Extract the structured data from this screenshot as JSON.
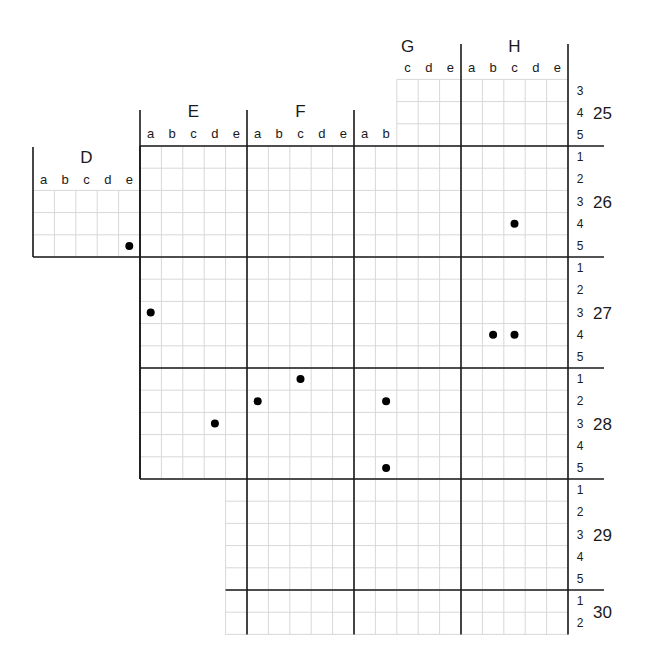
{
  "column_blocks": [
    {
      "label": "D",
      "subcolumns": [
        "a",
        "b",
        "c",
        "d",
        "e"
      ]
    },
    {
      "label": "E",
      "subcolumns": [
        "a",
        "b",
        "c",
        "d",
        "e"
      ]
    },
    {
      "label": "F",
      "subcolumns": [
        "a",
        "b",
        "c",
        "d",
        "e"
      ]
    },
    {
      "label": "G",
      "subcolumns": [
        "a",
        "b",
        "c",
        "d",
        "e"
      ]
    },
    {
      "label": "H",
      "subcolumns": [
        "a",
        "b",
        "c",
        "d",
        "e"
      ]
    }
  ],
  "row_bands": [
    {
      "label": "25",
      "subrows": [
        "3",
        "4",
        "5"
      ]
    },
    {
      "label": "26",
      "subrows": [
        "1",
        "2",
        "3",
        "4",
        "5"
      ]
    },
    {
      "label": "27",
      "subrows": [
        "1",
        "2",
        "3",
        "4",
        "5"
      ]
    },
    {
      "label": "28",
      "subrows": [
        "1",
        "2",
        "3",
        "4",
        "5"
      ]
    },
    {
      "label": "29",
      "subrows": [
        "1",
        "2",
        "3",
        "4",
        "5"
      ]
    },
    {
      "label": "30",
      "subrows": [
        "1",
        "2"
      ]
    }
  ],
  "marked_cells": [
    {
      "block": "D",
      "col": "e",
      "band": "26",
      "row": "5"
    },
    {
      "block": "H",
      "col": "c",
      "band": "26",
      "row": "4"
    },
    {
      "block": "E",
      "col": "a",
      "band": "27",
      "row": "3"
    },
    {
      "block": "H",
      "col": "b",
      "band": "27",
      "row": "4"
    },
    {
      "block": "H",
      "col": "c",
      "band": "27",
      "row": "4"
    },
    {
      "block": "F",
      "col": "c",
      "band": "28",
      "row": "1"
    },
    {
      "block": "F",
      "col": "a",
      "band": "28",
      "row": "2"
    },
    {
      "block": "G",
      "col": "b",
      "band": "28",
      "row": "2"
    },
    {
      "block": "E",
      "col": "d",
      "band": "28",
      "row": "3"
    },
    {
      "block": "G",
      "col": "b",
      "band": "28",
      "row": "5"
    }
  ],
  "colors": {
    "major_line": "#1a1a1a",
    "minor_line": "#d8d8d8",
    "dot": "#000000"
  }
}
